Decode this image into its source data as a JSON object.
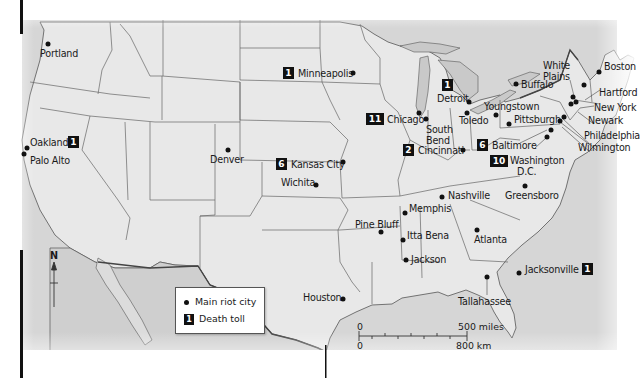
{
  "map": {
    "title": "Riots in the United States",
    "colors": {
      "land": "#e6e6e6",
      "water": "#d4d4d4",
      "border": "#555555",
      "marker": "#111111"
    }
  },
  "legend": {
    "main_riot_city": "Main riot city",
    "death_toll": "Death toll",
    "death_toll_sample": "1"
  },
  "compass": {
    "label": "N"
  },
  "scale": {
    "miles_zero": "0",
    "miles_label": "500 miles",
    "km_zero": "0",
    "km_label": "800 km"
  },
  "cities": [
    {
      "name": "Portland",
      "toll": null
    },
    {
      "name": "Oakland",
      "toll": "1"
    },
    {
      "name": "Palo Alto",
      "toll": null
    },
    {
      "name": "Denver",
      "toll": null
    },
    {
      "name": "Minneapolis",
      "toll": "1"
    },
    {
      "name": "Kansas City",
      "toll": "6"
    },
    {
      "name": "Wichita",
      "toll": null
    },
    {
      "name": "Chicago",
      "toll": "11"
    },
    {
      "name": "South Bend",
      "toll": null
    },
    {
      "name": "Detroit",
      "toll": "1"
    },
    {
      "name": "Toledo",
      "toll": null
    },
    {
      "name": "Youngstown",
      "toll": null
    },
    {
      "name": "Cincinnati",
      "toll": "2"
    },
    {
      "name": "Buffalo",
      "toll": null
    },
    {
      "name": "Pittsburgh",
      "toll": null
    },
    {
      "name": "Baltimore",
      "toll": "6"
    },
    {
      "name": "Washington D.C.",
      "toll": "10"
    },
    {
      "name": "White Plains",
      "toll": null
    },
    {
      "name": "Boston",
      "toll": null
    },
    {
      "name": "Hartford",
      "toll": null
    },
    {
      "name": "New York",
      "toll": null
    },
    {
      "name": "Newark",
      "toll": null
    },
    {
      "name": "Philadelphia",
      "toll": null
    },
    {
      "name": "Wilmington",
      "toll": null
    },
    {
      "name": "Nashville",
      "toll": null
    },
    {
      "name": "Greensboro",
      "toll": null
    },
    {
      "name": "Memphis",
      "toll": null
    },
    {
      "name": "Pine Bluff",
      "toll": null
    },
    {
      "name": "Itta Bena",
      "toll": null
    },
    {
      "name": "Jackson",
      "toll": null
    },
    {
      "name": "Atlanta",
      "toll": null
    },
    {
      "name": "Houston",
      "toll": null
    },
    {
      "name": "Tallahassee",
      "toll": null
    },
    {
      "name": "Jacksonville",
      "toll": "1"
    }
  ],
  "labels": {
    "portland": "Portland",
    "oakland": "Oakland",
    "palo_alto": "Palo Alto",
    "denver": "Denver",
    "minneapolis": "Minneapolis",
    "kansas_city": "Kansas City",
    "wichita": "Wichita",
    "chicago": "Chicago",
    "south_bend_1": "South",
    "south_bend_2": "Bend",
    "detroit": "Detroit",
    "toledo": "Toledo",
    "youngstown": "Youngstown",
    "cincinnati": "Cincinnati",
    "buffalo": "Buffalo",
    "pittsburgh": "Pittsburgh",
    "baltimore": "Baltimore",
    "washington_1": "Washington",
    "washington_2": "D.C.",
    "white_plains_1": "White",
    "white_plains_2": "Plains",
    "boston": "Boston",
    "hartford": "Hartford",
    "new_york": "New York",
    "newark": "Newark",
    "philadelphia": "Philadelphia",
    "wilmington": "Wilmington",
    "nashville": "Nashville",
    "greensboro": "Greensboro",
    "memphis": "Memphis",
    "pine_bluff": "Pine Bluff",
    "itta_bena": "Itta Bena",
    "jackson": "Jackson",
    "atlanta": "Atlanta",
    "houston": "Houston",
    "tallahassee": "Tallahassee",
    "jacksonville": "Jacksonville"
  },
  "tolls": {
    "oakland": "1",
    "minneapolis": "1",
    "kansas_city": "6",
    "chicago": "11",
    "detroit": "1",
    "cincinnati": "2",
    "baltimore": "6",
    "washington": "10",
    "jacksonville": "1"
  }
}
